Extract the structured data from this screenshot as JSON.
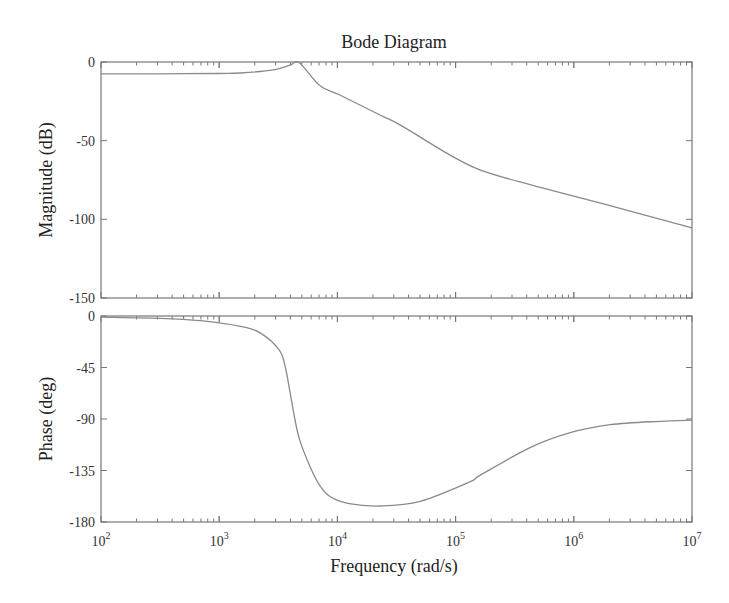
{
  "chart_data": {
    "type": "line",
    "title": "Bode Diagram",
    "xlabel": "Frequency (rad/s)",
    "xscale": "log",
    "xlim": [
      100,
      10000000
    ],
    "x_tick_labels": [
      {
        "base": "10",
        "exp": "2",
        "value": 100
      },
      {
        "base": "10",
        "exp": "3",
        "value": 1000
      },
      {
        "base": "10",
        "exp": "4",
        "value": 10000
      },
      {
        "base": "10",
        "exp": "5",
        "value": 100000
      },
      {
        "base": "10",
        "exp": "6",
        "value": 1000000
      },
      {
        "base": "10",
        "exp": "7",
        "value": 10000000
      }
    ],
    "grid": false,
    "legend": null,
    "subplots": [
      {
        "name": "magnitude",
        "ylabel": "Magnitude (dB)",
        "ylim": [
          -150,
          0
        ],
        "yticks": [
          0,
          -50,
          -100,
          -150
        ],
        "ytick_labels": [
          "0",
          "-50",
          "-100",
          "-150"
        ],
        "series": [
          {
            "name": "Magnitude",
            "color": "#8a8a8a",
            "log10_x": [
              2.0,
              2.5,
              3.0,
              3.18,
              3.46,
              3.6,
              3.68,
              3.85,
              4.02,
              4.36,
              4.53,
              4.95,
              5.21,
              5.63,
              6.22,
              7.0
            ],
            "y": [
              -7.6,
              -7.5,
              -7.3,
              -7.0,
              -5.0,
              -2.0,
              -0.6,
              -15.0,
              -21.0,
              -33.7,
              -40.0,
              -59.0,
              -68.7,
              -78.0,
              -89.6,
              -105.5
            ]
          }
        ]
      },
      {
        "name": "phase",
        "ylabel": "Phase (deg)",
        "ylim": [
          -180,
          0
        ],
        "yticks": [
          0,
          -45,
          -90,
          -135,
          -180
        ],
        "ytick_labels": [
          "0",
          "-45",
          "-90",
          "-135",
          "-180"
        ],
        "series": [
          {
            "name": "Phase",
            "color": "#8a8a8a",
            "log10_x": [
              2.0,
              2.5,
              2.84,
              3.18,
              3.35,
              3.51,
              3.56,
              3.6,
              3.64,
              3.68,
              3.77,
              3.85,
              3.94,
              4.1,
              4.36,
              4.7,
              5.12,
              5.21,
              5.63,
              5.97,
              6.31,
              6.73,
              7.0
            ],
            "y": [
              -1,
              -2,
              -4,
              -9,
              -15,
              -30,
              -45,
              -67,
              -90,
              -108,
              -132,
              -148,
              -158,
              -164,
              -166,
              -162,
              -145,
              -139,
              -115,
              -102,
              -95,
              -92,
              -91
            ]
          }
        ]
      }
    ]
  }
}
